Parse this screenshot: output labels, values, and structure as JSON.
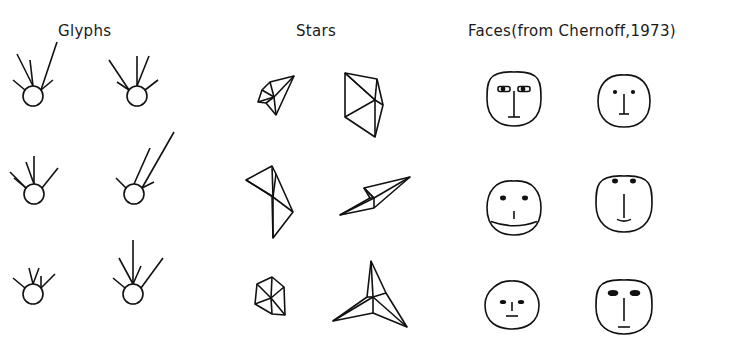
{
  "figure": {
    "panels": [
      {
        "id": "glyphs",
        "title": "Glyphs"
      },
      {
        "id": "stars",
        "title": "Stars"
      },
      {
        "id": "faces",
        "title": "Faces(from Chernoff,1973)"
      }
    ],
    "ink_color": "#111111",
    "background": "#ffffff"
  },
  "glyphs": {
    "circle_radius": 10,
    "items": [
      {
        "cx": 33,
        "cy": 96,
        "rays": [
          [
            -16,
            32,
            1
          ],
          [
            -3,
            26,
            1
          ],
          [
            16,
            48,
            0
          ],
          [
            -12,
            10,
            0
          ],
          [
            12,
            10,
            0
          ]
        ]
      },
      {
        "cx": 137,
        "cy": 96,
        "rays": [
          [
            -20,
            30,
            0
          ],
          [
            0,
            30,
            1
          ],
          [
            12,
            30,
            1
          ],
          [
            -12,
            8,
            0
          ],
          [
            13,
            10,
            0
          ]
        ]
      },
      {
        "cx": 34,
        "cy": 194,
        "rays": [
          [
            0,
            28,
            1
          ],
          [
            -8,
            22,
            1
          ],
          [
            -16,
            16,
            0
          ],
          [
            16,
            20,
            0
          ],
          [
            -12,
            10,
            0
          ]
        ]
      },
      {
        "cx": 134,
        "cy": 194,
        "rays": [
          [
            -10,
            10,
            0
          ],
          [
            16,
            36,
            1
          ],
          [
            32,
            56,
            0
          ],
          [
            12,
            6,
            0
          ]
        ]
      },
      {
        "cx": 33,
        "cy": 294,
        "rays": [
          [
            -4,
            16,
            1
          ],
          [
            6,
            16,
            1
          ],
          [
            -12,
            10,
            0
          ],
          [
            14,
            14,
            0
          ],
          [
            0,
            12,
            0
          ]
        ]
      },
      {
        "cx": 133,
        "cy": 294,
        "rays": [
          [
            0,
            44,
            1
          ],
          [
            -14,
            26,
            1
          ],
          [
            8,
            18,
            1
          ],
          [
            22,
            30,
            0
          ],
          [
            -12,
            10,
            0
          ]
        ]
      }
    ]
  },
  "stars": {
    "items": [
      {
        "cx": 274,
        "cy": 97,
        "points": [
          [
            20,
            -21
          ],
          [
            -4,
            -15
          ],
          [
            -12,
            -7
          ],
          [
            -16,
            5
          ],
          [
            -8,
            6
          ],
          [
            2,
            18
          ]
        ]
      },
      {
        "cx": 375,
        "cy": 100,
        "points": [
          [
            -30,
            -27
          ],
          [
            2,
            -21
          ],
          [
            8,
            5
          ],
          [
            0,
            37
          ],
          [
            -30,
            17
          ],
          [
            -30,
            -27
          ]
        ]
      },
      {
        "cx": 273,
        "cy": 197,
        "points": [
          [
            -27,
            -17
          ],
          [
            -1,
            -31
          ],
          [
            3,
            -23
          ],
          [
            20,
            15
          ],
          [
            0,
            41
          ],
          [
            -1,
            -1
          ]
        ]
      },
      {
        "cx": 374,
        "cy": 198,
        "points": [
          [
            -10,
            -10
          ],
          [
            36,
            -21
          ],
          [
            0,
            10
          ],
          [
            -34,
            17
          ],
          [
            -4,
            0
          ],
          [
            -10,
            -10
          ]
        ]
      },
      {
        "cx": 271,
        "cy": 298,
        "points": [
          [
            -14,
            -14
          ],
          [
            1,
            -21
          ],
          [
            13,
            -11
          ],
          [
            14,
            17
          ],
          [
            1,
            16
          ],
          [
            -16,
            6
          ]
        ]
      },
      {
        "cx": 373,
        "cy": 297,
        "points": [
          [
            -2,
            -36
          ],
          [
            13,
            -4
          ],
          [
            34,
            30
          ],
          [
            0,
            16
          ],
          [
            -40,
            24
          ],
          [
            -6,
            0
          ]
        ]
      }
    ]
  },
  "faces": {
    "items": [
      {
        "cx": 514,
        "cy": 99,
        "rx": 27,
        "ry": 27,
        "top_taper": 0.0,
        "eyes": "eyebrow-boxes",
        "eye_dx": 10,
        "eye_y": -10,
        "nose": [
          -8,
          18
        ],
        "mouth": {
          "y": 18,
          "w": 12,
          "curve": 0
        }
      },
      {
        "cx": 624,
        "cy": 101,
        "rx": 26,
        "ry": 26,
        "top_taper": 0.35,
        "eyes": "dots",
        "eye_dx": 9,
        "eye_y": -9,
        "nose": [
          -7,
          13
        ],
        "mouth": {
          "y": 13,
          "w": 10,
          "curve": 0
        }
      },
      {
        "cx": 514,
        "cy": 208,
        "rx": 27,
        "ry": 27,
        "top_taper": 0.3,
        "eyes": "dots-large",
        "eye_dx": 11,
        "eye_y": -10,
        "nose": [
          3,
          11
        ],
        "mouth": {
          "y": 15,
          "w": 46,
          "curve": 5
        }
      },
      {
        "cx": 624,
        "cy": 204,
        "rx": 28,
        "ry": 28,
        "top_taper": 0.0,
        "eyes": "dots-top",
        "eye_dx": 9,
        "eye_y": -23,
        "nose": [
          -10,
          14
        ],
        "mouth": {
          "y": 16,
          "w": 14,
          "curve": 2
        }
      },
      {
        "cx": 512,
        "cy": 305,
        "rx": 27,
        "ry": 24,
        "top_taper": 0.55,
        "eyes": "dashes",
        "eye_dx": 9,
        "eye_y": -3,
        "nose": [
          -3,
          6
        ],
        "mouth": {
          "y": 11,
          "w": 12,
          "curve": 0
        }
      },
      {
        "cx": 624,
        "cy": 307,
        "rx": 28,
        "ry": 27,
        "top_taper": 0.0,
        "eyes": "brows-dark",
        "eye_dx": 11,
        "eye_y": -14,
        "nose": [
          -9,
          14
        ],
        "mouth": {
          "y": 20,
          "w": 12,
          "curve": 0
        }
      }
    ]
  }
}
